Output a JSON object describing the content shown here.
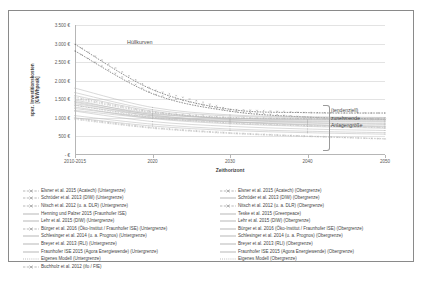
{
  "chart_data": {
    "type": "line",
    "title": "",
    "xlabel": "Zeithorizont",
    "ylabel": "spez. Investitionskosten\n[€/kWhpeak]",
    "x": [
      "2010-2015",
      "2020",
      "2030",
      "2040",
      "2050"
    ],
    "xticks": [
      "2010-2015",
      "2020",
      "2030",
      "2040",
      "2050"
    ],
    "yticks": [
      "3.500 €",
      "3.000 €",
      "2.500 €",
      "2.000 €",
      "1.500 €",
      "1.000 €",
      "500 €",
      "- €"
    ],
    "ylim": [
      0,
      3500
    ],
    "grid": true,
    "legend_position": "bottom",
    "annotations": [
      {
        "text": "Hüllkurven"
      },
      {
        "text": "(tendenziell)"
      },
      {
        "text": "zunehmende"
      },
      {
        "text": "Anlagengröße"
      }
    ],
    "series": [
      {
        "name": "Elsner et al. 2015 (Acatech) (Untergrenze)",
        "values": [
          2800,
          1650,
          1180,
          1020,
          960
        ],
        "style": "dashed-marker"
      },
      {
        "name": "Schröder et al. 2013 (DIW) (Untergrenze)",
        "values": [
          1600,
          1180,
          960,
          870,
          820
        ],
        "style": "solid"
      },
      {
        "name": "Nitsch et al. 2012 (u. a. DLR) (Untergrenze)",
        "values": [
          1340,
          1010,
          860,
          790,
          740
        ],
        "style": "dashed-marker"
      },
      {
        "name": "Henning und Palzer 2015 (Fraunhofer ISE)",
        "values": [
          1480,
          1080,
          900,
          820,
          780
        ],
        "style": "solid"
      },
      {
        "name": "Lehr et al. 2015 (DIW) (Untergrenze)",
        "values": [
          1000,
          780,
          660,
          600,
          560
        ],
        "style": "solid"
      },
      {
        "name": "Bürger et al. 2016 (Öko-Institut / Fraunhofer ISE) (Untergrenze)",
        "values": [
          990,
          740,
          600,
          510,
          440
        ],
        "style": "dashed-marker"
      },
      {
        "name": "Schlesinger et al. 2014 (u. a. Prognos) (Untergrenze)",
        "values": [
          1290,
          980,
          840,
          770,
          720
        ],
        "style": "solid"
      },
      {
        "name": "Breyer et al. 2013 (RLI) (Untergrenze)",
        "values": [
          1420,
          1050,
          890,
          810,
          760
        ],
        "style": "solid"
      },
      {
        "name": "Fraunhofer ISE 2015 (Agora Energiewende) (Untergrenze)",
        "values": [
          1180,
          900,
          770,
          700,
          660
        ],
        "style": "solid"
      },
      {
        "name": "Eigenes Modell (Untergrenze)",
        "values": [
          1060,
          830,
          700,
          640,
          600
        ],
        "style": "solid"
      },
      {
        "name": "Buchholz et al. 2012 (ifo / FfE)",
        "values": [
          960,
          720,
          580,
          500,
          430
        ],
        "style": "dashed-marker"
      },
      {
        "name": "Elsner et al. 2015 (Acatech) (Obergrenze)",
        "values": [
          2980,
          1760,
          1230,
          1140,
          1130
        ],
        "style": "dashed-marker"
      },
      {
        "name": "Schröder et al. 2013 (DIW) (Obergrenze)",
        "values": [
          1800,
          1280,
          1080,
          1030,
          1010
        ],
        "style": "solid"
      },
      {
        "name": "Nitsch et al. 2012 (u. a. DLR) (Obergrenze)",
        "values": [
          1560,
          1160,
          1010,
          980,
          970
        ],
        "style": "dashed-marker"
      },
      {
        "name": "Teske et al. 2015 (Greenpeace)",
        "values": [
          1380,
          1100,
          990,
          960,
          950
        ],
        "style": "solid"
      },
      {
        "name": "Lehr et al. 2015 (DIW) (Obergrenze)",
        "values": [
          1250,
          1020,
          930,
          900,
          890
        ],
        "style": "solid"
      },
      {
        "name": "Bürger et al. 2016 (Öko-Institut / Fraunhofer ISE) (Obergrenze)",
        "values": [
          1520,
          1140,
          1000,
          970,
          960
        ],
        "style": "dashed-marker"
      },
      {
        "name": "Schlesinger et al. 2014 (u. a. Prognos) (Obergrenze)",
        "values": [
          1340,
          1060,
          950,
          920,
          910
        ],
        "style": "solid"
      },
      {
        "name": "Breyer et al. 2013 (RLI) (Obergrenze)",
        "values": [
          1680,
          1220,
          1050,
          1010,
          1000
        ],
        "style": "solid"
      },
      {
        "name": "Fraunhofer ISE 2015 (Agora Energiewende) (Obergrenze)",
        "values": [
          1440,
          1120,
          980,
          950,
          940
        ],
        "style": "solid"
      },
      {
        "name": "Eigenes Modell (Obergrenze)",
        "values": [
          1200,
          990,
          890,
          860,
          850
        ],
        "style": "solid"
      }
    ]
  },
  "legend": {
    "left_column": [
      {
        "label": "Elsner et al. 2015 (Acatech) (Untergrenze)",
        "style": "dashed-marker"
      },
      {
        "label": "Schröder et al. 2013 (DIW) (Untergrenze)",
        "style": "dashed-marker"
      },
      {
        "label": "Nitsch et al. 2012 (u. a. DLR) (Untergrenze)",
        "style": "dashed-marker"
      },
      {
        "label": "Henning und Palzer 2015 (Fraunhofer ISE)",
        "style": "solid"
      },
      {
        "label": "Lehr et al. 2015 (DIW) (Untergrenze)",
        "style": "solid"
      },
      {
        "label": "Bürger et al. 2016 (Öko-Institut / Fraunhofer ISE) (Untergrenze)",
        "style": "dashed-marker"
      },
      {
        "label": "Schlesinger et al. 2014 (u. a. Prognos) (Untergrenze)",
        "style": "solid"
      },
      {
        "label": "Breyer et al. 2013 (RLI) (Untergrenze)",
        "style": "solid"
      },
      {
        "label": "Fraunhofer ISE 2015 (Agora Energiewende) (Untergrenze)",
        "style": "solid"
      },
      {
        "label": "Eigenes Modell (Untergrenze)",
        "style": "dotted"
      },
      {
        "label": "Buchholz et al. 2012 (ifo / FfE)",
        "style": "dashed-marker"
      }
    ],
    "right_column": [
      {
        "label": "Elsner et al. 2015 (Acatech) (Obergrenze)",
        "style": "dashed-marker"
      },
      {
        "label": "Schröder et al. 2013 (DIW) (Obergrenze)",
        "style": "solid"
      },
      {
        "label": "Nitsch et al. 2012 (u. a. DLR) (Obergrenze)",
        "style": "dashed-marker"
      },
      {
        "label": "Teske et al. 2015 (Greenpeace)",
        "style": "solid"
      },
      {
        "label": "Lehr et al. 2015 (DIW) (Obergrenze)",
        "style": "solid"
      },
      {
        "label": "Bürger et al. 2016 (Öko-Institut / Fraunhofer ISE) (Obergrenze)",
        "style": "solid"
      },
      {
        "label": "Schlesinger et al. 2014 (u. a. Prognos) (Obergrenze)",
        "style": "solid"
      },
      {
        "label": "Breyer et al. 2013 (RLI) (Obergrenze)",
        "style": "solid"
      },
      {
        "label": "Fraunhofer ISE 2015 (Agora Energiewende) (Obergrenze)",
        "style": "solid"
      },
      {
        "label": "Eigenes Modell (Obergrenze)",
        "style": "dotted"
      }
    ]
  },
  "colors": {
    "frame": "#8a8a8a",
    "grid": "#e3e3e3",
    "axis": "#b6b6b6",
    "text": "#3f3f3f",
    "curve_light": "#b9b9b9",
    "curve_dark": "#6e6e6e"
  }
}
